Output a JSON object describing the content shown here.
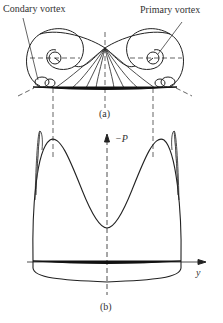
{
  "figure_a": {
    "caption": "(a)",
    "labels": {
      "secondary_vortex": "Condary vortex",
      "primary_vortex": "Primary vortex"
    }
  },
  "figure_b": {
    "caption": "(b)",
    "axis_vertical": "−P",
    "axis_horizontal": "y"
  },
  "colors": {
    "line": "#222222",
    "background": "#ffffff"
  }
}
